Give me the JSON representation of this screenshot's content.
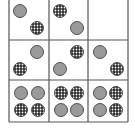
{
  "puzzle": {
    "type": "3x3 matrix reasoning",
    "colors": {
      "grid_line": "#555555",
      "gray_fill": "#9a9a9a",
      "outline": "#444444",
      "dotted_fill": "#2a2a2a",
      "dot": "#ffffff"
    },
    "grid": {
      "x": [
        9,
        49,
        88,
        128
      ],
      "y": [
        -2,
        40,
        80,
        122
      ]
    },
    "radius": 6.5,
    "cells": [
      {
        "row": 0,
        "col": 0,
        "shapes": [
          {
            "kind": "gray",
            "cx": 20,
            "cy": 11
          },
          {
            "kind": "dotted",
            "cx": 37,
            "cy": 28
          }
        ]
      },
      {
        "row": 0,
        "col": 1,
        "shapes": [
          {
            "kind": "dotted",
            "cx": 60,
            "cy": 11
          },
          {
            "kind": "gray",
            "cx": 77,
            "cy": 28
          }
        ]
      },
      {
        "row": 0,
        "col": 2,
        "shapes": []
      },
      {
        "row": 1,
        "col": 0,
        "shapes": [
          {
            "kind": "gray",
            "cx": 37,
            "cy": 52
          },
          {
            "kind": "dotted",
            "cx": 20,
            "cy": 69
          }
        ]
      },
      {
        "row": 1,
        "col": 1,
        "shapes": [
          {
            "kind": "dotted",
            "cx": 77,
            "cy": 52
          },
          {
            "kind": "gray",
            "cx": 60,
            "cy": 69
          }
        ]
      },
      {
        "row": 1,
        "col": 2,
        "shapes": [
          {
            "kind": "gray",
            "cx": 100,
            "cy": 52
          },
          {
            "kind": "dotted",
            "cx": 117,
            "cy": 69
          }
        ]
      },
      {
        "row": 2,
        "col": 0,
        "shapes": [
          {
            "kind": "gray",
            "cx": 21,
            "cy": 93
          },
          {
            "kind": "gray",
            "cx": 38,
            "cy": 93
          },
          {
            "kind": "dotted",
            "cx": 21,
            "cy": 110
          },
          {
            "kind": "dotted",
            "cx": 38,
            "cy": 110
          }
        ]
      },
      {
        "row": 2,
        "col": 1,
        "shapes": [
          {
            "kind": "dotted",
            "cx": 61,
            "cy": 93
          },
          {
            "kind": "dotted",
            "cx": 77,
            "cy": 93
          },
          {
            "kind": "gray",
            "cx": 61,
            "cy": 110
          },
          {
            "kind": "gray",
            "cx": 77,
            "cy": 110
          }
        ]
      },
      {
        "row": 2,
        "col": 2,
        "shapes": [
          {
            "kind": "gray",
            "cx": 100,
            "cy": 93
          },
          {
            "kind": "dotted",
            "cx": 116,
            "cy": 93
          },
          {
            "kind": "gray",
            "cx": 100,
            "cy": 110
          },
          {
            "kind": "dotted",
            "cx": 116,
            "cy": 110
          }
        ]
      }
    ]
  }
}
